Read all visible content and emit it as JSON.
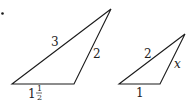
{
  "figure": {
    "marker": "•",
    "stroke_color": "#1a1a1a",
    "text_color": "#222222"
  },
  "triangle_large": {
    "vertices": {
      "bottom_left": [
        12,
        84
      ],
      "bottom_right": [
        74,
        84
      ],
      "top": [
        111,
        9
      ]
    },
    "labels": {
      "left_side": "3",
      "right_side": "2",
      "base_whole": "1",
      "base_frac_num": "1",
      "base_frac_den": "2"
    }
  },
  "triangle_small": {
    "vertices": {
      "bottom_left": [
        119,
        84
      ],
      "bottom_right": [
        160,
        84
      ],
      "top": [
        185,
        34
      ]
    },
    "labels": {
      "left_side": "2",
      "right_side": "x",
      "base": "1"
    }
  }
}
